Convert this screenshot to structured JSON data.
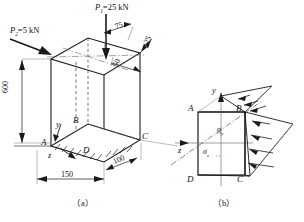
{
  "figure": {
    "title_caption_a": "（a）",
    "title_caption_b": "（b）"
  },
  "loads": {
    "p1_label": "P",
    "p1_sub": "1",
    "p1_value": "=25 kN",
    "p2_label": "P",
    "p2_sub": "2",
    "p2_value": "=5 kN"
  },
  "dimensions": {
    "height": "600",
    "width_front": "150",
    "depth": "100",
    "ecc_top": "75",
    "ecc_right": "25",
    "ecc_mid": "50"
  },
  "vertices_a": {
    "A": "A",
    "B": "B",
    "C": "C",
    "D": "D"
  },
  "axes_a": {
    "y": "y",
    "z": "z"
  },
  "vertices_b": {
    "A": "A",
    "B": "B",
    "C": "C",
    "D": "D"
  },
  "axes_b": {
    "y": "y",
    "z": "z"
  },
  "stresses": {
    "sigma_top_symbol": "σ",
    "sigma_top_sub": "y",
    "sigma_bottom_symbol": "σ",
    "sigma_bottom_sub": "z"
  },
  "colors": {
    "line": "#1a1a1a",
    "hidden": "#555555",
    "thin": "#777777"
  }
}
